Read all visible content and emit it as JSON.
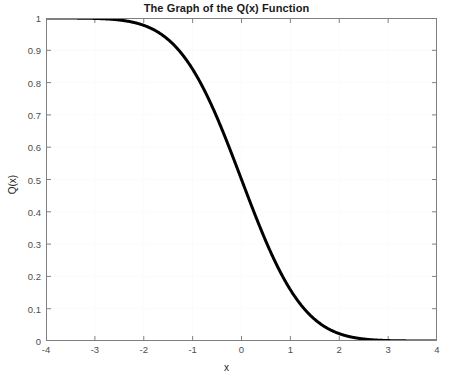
{
  "chart_data": {
    "type": "line",
    "title": "The Graph of the Q(x) Function",
    "xlabel": "x",
    "ylabel": "Q(x)",
    "xlim": [
      -4,
      4
    ],
    "ylim": [
      0,
      1
    ],
    "grid": true,
    "legend": null,
    "xticks": [
      -4,
      -3,
      -2,
      -1,
      0,
      1,
      2,
      3,
      4
    ],
    "xtick_labels": [
      "-4",
      "-3",
      "-2",
      "-1",
      "0",
      "1",
      "2",
      "3",
      "4"
    ],
    "yticks": [
      0,
      0.1,
      0.2,
      0.3,
      0.4,
      0.5,
      0.6,
      0.7,
      0.8,
      0.9,
      1
    ],
    "ytick_labels": [
      "0",
      "0.1",
      "0.2",
      "0.3",
      "0.4",
      "0.5",
      "0.6",
      "0.7",
      "0.8",
      "0.9",
      "1"
    ],
    "series": [
      {
        "name": "Q(x)",
        "color": "#000000",
        "linewidth": 3,
        "x": [
          -4,
          -3.8,
          -3.6,
          -3.4,
          -3.2,
          -3,
          -2.8,
          -2.6,
          -2.4,
          -2.2,
          -2,
          -1.8,
          -1.6,
          -1.4,
          -1.2,
          -1,
          -0.8,
          -0.6,
          -0.4,
          -0.2,
          0,
          0.2,
          0.4,
          0.6,
          0.8,
          1,
          1.2,
          1.4,
          1.6,
          1.8,
          2,
          2.2,
          2.4,
          2.6,
          2.8,
          3,
          3.2,
          3.4,
          3.6,
          3.8,
          4
        ],
        "y": [
          0.99997,
          0.99993,
          0.99984,
          0.99966,
          0.99931,
          0.99865,
          0.99744,
          0.99534,
          0.9918,
          0.9861,
          0.97725,
          0.96407,
          0.9452,
          0.91924,
          0.88493,
          0.84134,
          0.78814,
          0.72575,
          0.65542,
          0.57926,
          0.5,
          0.42074,
          0.34458,
          0.27425,
          0.21186,
          0.15866,
          0.11507,
          0.08076,
          0.0548,
          0.03593,
          0.02275,
          0.0139,
          0.0082,
          0.00466,
          0.00256,
          0.00135,
          0.00069,
          0.00034,
          0.00016,
          7e-05,
          3e-05
        ]
      }
    ]
  },
  "axes_style": {
    "box_color": "#808080",
    "grid_color": "#fbfbfb",
    "tick_color": "#808080",
    "background": "#ffffff"
  }
}
